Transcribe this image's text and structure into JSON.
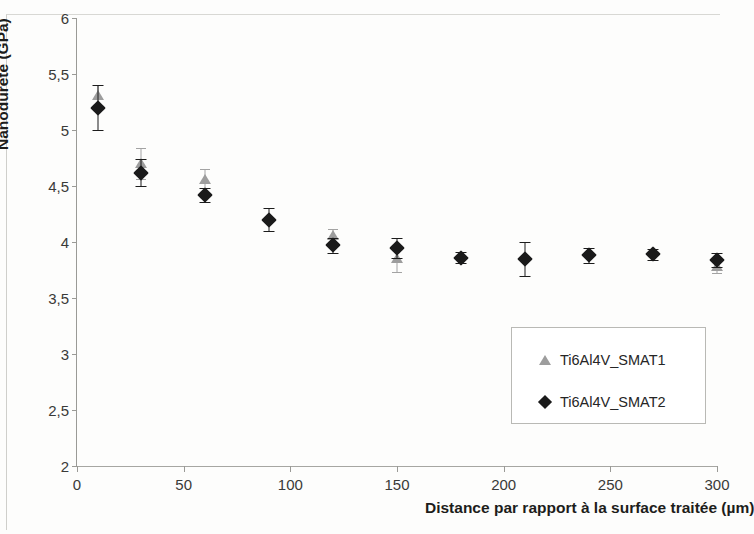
{
  "chart_data": {
    "type": "scatter",
    "title": "",
    "xlabel": "Distance par rapport à la surface traitée (µm)",
    "ylabel": "Nanodureté (GPa)",
    "xlim": [
      0,
      300
    ],
    "ylim": [
      2,
      6
    ],
    "xticks": [
      0,
      50,
      100,
      150,
      200,
      250,
      300
    ],
    "xtick_labels": [
      "0",
      "50",
      "100",
      "150",
      "200",
      "250",
      "300"
    ],
    "yticks": [
      2,
      2.5,
      3,
      3.5,
      4,
      4.5,
      5,
      5.5,
      6
    ],
    "ytick_labels": [
      "2",
      "2,5",
      "3",
      "3,5",
      "4",
      "4,5",
      "5",
      "5,5",
      "6"
    ],
    "grid": false,
    "legend_position": "lower right",
    "error_bars": true,
    "series": [
      {
        "name": "Ti6Al4V_SMAT1",
        "marker": "triangle",
        "color": "#9d9d9d",
        "x": [
          10,
          30,
          60,
          120,
          150,
          300
        ],
        "values": [
          5.3,
          4.7,
          4.55,
          4.05,
          3.85,
          3.78
        ],
        "yerr": [
          0.1,
          0.14,
          0.1,
          0.07,
          0.12,
          0.06
        ]
      },
      {
        "name": "Ti6Al4V_SMAT2",
        "marker": "diamond",
        "color": "#1a1a1a",
        "x": [
          10,
          30,
          60,
          90,
          120,
          150,
          180,
          210,
          240,
          270,
          300
        ],
        "values": [
          5.2,
          4.62,
          4.42,
          4.2,
          3.97,
          3.95,
          3.86,
          3.85,
          3.88,
          3.89,
          3.84
        ],
        "yerr": [
          0.2,
          0.12,
          0.06,
          0.1,
          0.07,
          0.09,
          0.05,
          0.15,
          0.07,
          0.05,
          0.06
        ]
      }
    ]
  },
  "legend": {
    "entries": [
      {
        "label": "Ti6Al4V_SMAT1"
      },
      {
        "label": "Ti6Al4V_SMAT2"
      }
    ]
  }
}
